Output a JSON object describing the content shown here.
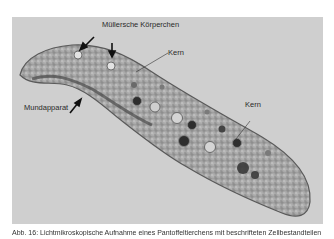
{
  "figure": {
    "labels": {
      "muellersche_koerperchen": "Müllersche Körperchen",
      "kern_upper": "Kern",
      "kern_right": "Kern",
      "mundapparat": "Mundapparat"
    },
    "colors": {
      "background": "#cfcfcf",
      "cell_body": "#a9a9a9",
      "cell_edge": "#5a5a5a",
      "vacuole_dark": "#2e2e2e",
      "label_text": "#2a2a2a"
    }
  },
  "caption": {
    "text": "Abb. 16: Lichtmikroskopische Aufnahme eines Pantoffeltierchens mit beschrifteten Zellbestandteilen"
  }
}
